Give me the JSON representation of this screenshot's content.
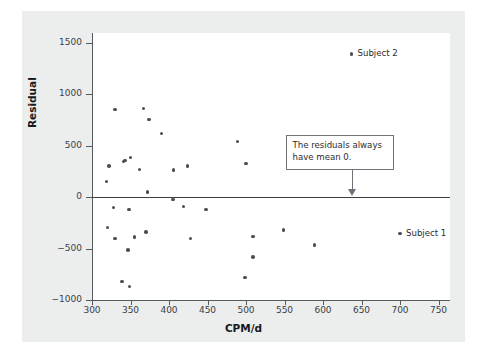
{
  "figure": {
    "background_color": "#eceded",
    "plot_background_color": "#ffffff",
    "point_color": "#4a4f55",
    "axis_color": "#555a5e"
  },
  "chart_data": {
    "type": "scatter",
    "title": "",
    "xlabel": "CPM/d",
    "ylabel": "Residual",
    "xlim": [
      300,
      765
    ],
    "ylim": [
      -1000,
      1560
    ],
    "grid": false,
    "xticks": [
      300,
      350,
      400,
      450,
      500,
      550,
      600,
      650,
      700,
      750
    ],
    "yticks": [
      1500,
      1000,
      500,
      0,
      -500,
      -1000
    ],
    "xtick_labels": [
      "300",
      "350",
      "400",
      "450",
      "500",
      "550",
      "600",
      "650",
      "700",
      "750"
    ],
    "ytick_labels": [
      "1500",
      "1000",
      "500",
      "0",
      "−500",
      "−1000"
    ],
    "reference_lines": [
      {
        "axis": "y",
        "value": 0,
        "label": "zero residual line"
      }
    ],
    "points": [
      {
        "x": 319,
        "y": 155
      },
      {
        "x": 322,
        "y": 305
      },
      {
        "x": 330,
        "y": 855
      },
      {
        "x": 341,
        "y": 345
      },
      {
        "x": 343,
        "y": 355
      },
      {
        "x": 350,
        "y": 385
      },
      {
        "x": 362,
        "y": 270
      },
      {
        "x": 367,
        "y": 865
      },
      {
        "x": 374,
        "y": 755
      },
      {
        "x": 372,
        "y": 52
      },
      {
        "x": 390,
        "y": 620
      },
      {
        "x": 406,
        "y": 265
      },
      {
        "x": 424,
        "y": 305
      },
      {
        "x": 489,
        "y": 540
      },
      {
        "x": 500,
        "y": 330
      },
      {
        "x": 405,
        "y": -20
      },
      {
        "x": 328,
        "y": -100
      },
      {
        "x": 348,
        "y": -120
      },
      {
        "x": 419,
        "y": -90
      },
      {
        "x": 448,
        "y": -120
      },
      {
        "x": 320,
        "y": -295
      },
      {
        "x": 330,
        "y": -400
      },
      {
        "x": 355,
        "y": -385
      },
      {
        "x": 370,
        "y": -340
      },
      {
        "x": 347,
        "y": -515
      },
      {
        "x": 428,
        "y": -400
      },
      {
        "x": 509,
        "y": -382
      },
      {
        "x": 549,
        "y": -320
      },
      {
        "x": 589,
        "y": -465
      },
      {
        "x": 509,
        "y": -580
      },
      {
        "x": 499,
        "y": -780
      },
      {
        "x": 339,
        "y": -818
      },
      {
        "x": 349,
        "y": -870
      }
    ],
    "annotations": [
      {
        "type": "callout",
        "text": "The residuals always have mean 0.",
        "text_lines": [
          "The residuals always",
          "have mean 0."
        ],
        "points_to": {
          "x": 637,
          "y": 35
        }
      },
      {
        "type": "point-label",
        "label": "Subject 2",
        "point": {
          "x": 637,
          "y": 1395
        }
      },
      {
        "type": "point-label",
        "label": "Subject 1",
        "point": {
          "x": 700,
          "y": -355
        }
      }
    ]
  }
}
